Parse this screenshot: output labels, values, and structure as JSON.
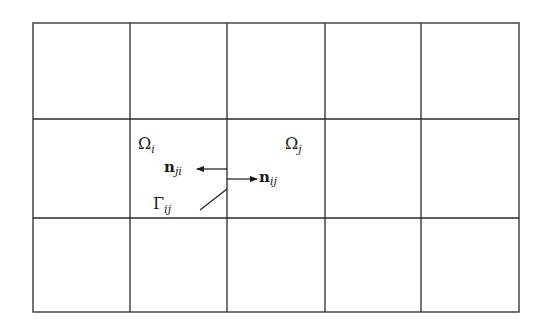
{
  "figure": {
    "type": "structured-grid-mesh",
    "grid": {
      "columns": 5,
      "rows": 3,
      "x_lines": [
        33,
        130,
        227,
        325,
        421,
        519
      ],
      "y_lines": [
        23,
        119,
        218,
        312
      ],
      "line_color": "#2a2a2a"
    },
    "labels": {
      "omega_i": {
        "base": "Ω",
        "sub": "i"
      },
      "omega_j": {
        "base": "Ω",
        "sub": "j"
      },
      "n_ji": {
        "base": "n",
        "sub": "ji"
      },
      "n_ij": {
        "base": "n",
        "sub": "ij"
      },
      "gamma_ij": {
        "base": "Γ",
        "sub": "ij"
      }
    }
  }
}
